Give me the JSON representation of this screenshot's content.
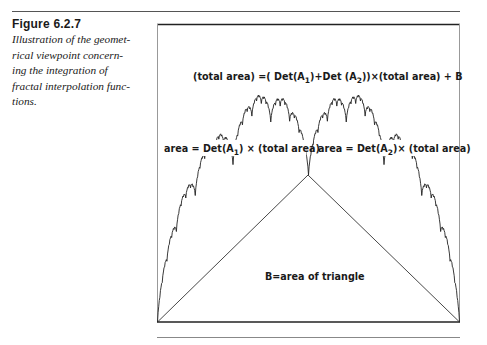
{
  "caption": {
    "title": "Figure  6.2.7",
    "lines": [
      "Illustration of the geomet-",
      "rical viewpoint concern-",
      "ing the integration of",
      "fractal interpolation func-",
      "tions."
    ]
  },
  "figure": {
    "equation": {
      "prefix": "(total area) =( Det(A",
      "sub1": "1",
      "mid": ")+Det (A",
      "sub2": "2",
      "suffix": "))×(total area) + B"
    },
    "label_left": {
      "prefix": "area = Det(A",
      "sub": "1",
      "suffix": ") × (total area)"
    },
    "label_right": {
      "prefix": "area = Det(A",
      "sub": "2",
      "suffix": ")× (total area)"
    },
    "label_triangle": "B=area of triangle"
  },
  "chart_data": {
    "type": "line",
    "interpolation_points": [
      [
        0,
        0
      ],
      [
        0.5,
        0.487
      ],
      [
        1,
        0
      ]
    ],
    "vertical_scaling": 0.57,
    "annotations": [
      "(total area) =( Det(A1)+Det (A2))×(total area) + B",
      "area = Det(A1) × (total area)",
      "area = Det(A2)× (total area)",
      "B=area of triangle"
    ],
    "xlim": [
      0,
      1
    ],
    "grid": false
  }
}
